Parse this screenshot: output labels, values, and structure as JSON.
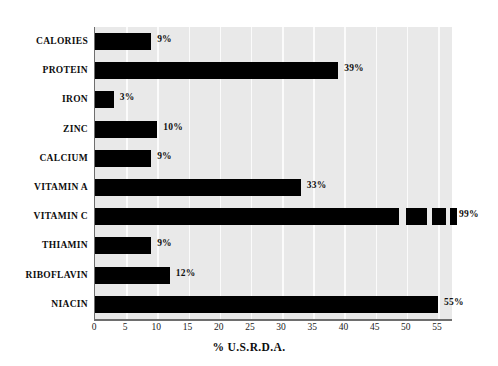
{
  "chart_data": {
    "type": "bar",
    "orientation": "horizontal",
    "title": "",
    "xlabel": "% U.S.R.D.A.",
    "ylabel": "",
    "xlim": [
      0,
      55
    ],
    "xticks": [
      0,
      5,
      10,
      15,
      20,
      25,
      30,
      35,
      40,
      45,
      50,
      55
    ],
    "tick_labels": [
      "0",
      "5",
      "10",
      "15",
      "20",
      "25",
      "30",
      "35",
      "40",
      "45",
      "50",
      "55"
    ],
    "grid": "vertical-white-gridlines",
    "legend": "none",
    "categories": [
      "CALORIES",
      "PROTEIN",
      "IRON",
      "ZINC",
      "CALCIUM",
      "VITAMIN A",
      "VITAMIN C",
      "THIAMIN",
      "RIBOFLAVIN",
      "NIACIN"
    ],
    "values": [
      9,
      39,
      3,
      10,
      9,
      33,
      99,
      9,
      12,
      55
    ],
    "data_labels": [
      "9%",
      "39%",
      "3%",
      "10%",
      "9%",
      "33%",
      "99%",
      "9%",
      "12%",
      "55%"
    ],
    "colors": {
      "bar": "#000000",
      "panel_background": "#e9e9e9",
      "gridline": "#fbfbfb",
      "axis": "#6e6e6e",
      "text": "#0d0d0d",
      "page_background": "#ffffff"
    }
  },
  "bars": [
    {
      "label": "CALORIES",
      "value": 9,
      "data_label": "9%",
      "broken": false
    },
    {
      "label": "PROTEIN",
      "value": 39,
      "data_label": "39%",
      "broken": false
    },
    {
      "label": "IRON",
      "value": 3,
      "data_label": "3%",
      "broken": false
    },
    {
      "label": "ZINC",
      "value": 10,
      "data_label": "10%",
      "broken": false
    },
    {
      "label": "CALCIUM",
      "value": 9,
      "data_label": "9%",
      "broken": false
    },
    {
      "label": "VITAMIN A",
      "value": 33,
      "data_label": "33%",
      "broken": false
    },
    {
      "label": "VITAMIN C",
      "value": 99,
      "data_label": "99%",
      "broken": true
    },
    {
      "label": "THIAMIN",
      "value": 9,
      "data_label": "9%",
      "broken": false
    },
    {
      "label": "RIBOFLAVIN",
      "value": 12,
      "data_label": "12%",
      "broken": false
    },
    {
      "label": "NIACIN",
      "value": 55,
      "data_label": "55%",
      "broken": false
    }
  ]
}
